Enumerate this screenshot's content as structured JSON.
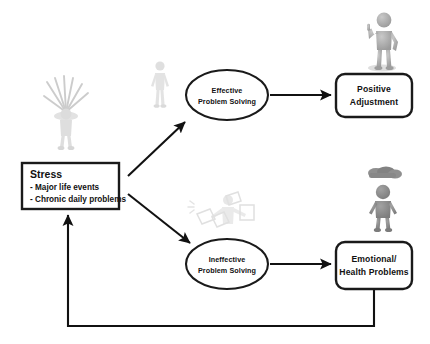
{
  "diagram": {
    "background_color": "#ffffff",
    "stroke_color": "#111111",
    "nodes": {
      "stress": {
        "shape": "rectangle",
        "heading": "Stress",
        "bullets": [
          "- Major life events",
          "- Chronic daily problems"
        ]
      },
      "effective": {
        "shape": "ellipse",
        "line1": "Effective",
        "line2": "Problem Solving"
      },
      "ineffective": {
        "shape": "ellipse",
        "line1": "Ineffective",
        "line2": "Problem Solving"
      },
      "positive": {
        "shape": "rounded-rectangle",
        "line1": "Positive",
        "line2": "Adjustment"
      },
      "emotional": {
        "shape": "rounded-rectangle",
        "line1": "Emotional/",
        "line2": "Health Problems"
      }
    },
    "figures": [
      {
        "name": "stressed-person-figure",
        "description": "pale grey figure with radiating stress lines",
        "color": "#cfcfcf"
      },
      {
        "name": "thinking-person-figure",
        "description": "pale grey standing figure",
        "color": "#dcdcdc"
      },
      {
        "name": "puzzled-person-figure",
        "description": "very pale grey figure with scattered papers",
        "color": "#e2e2e2"
      },
      {
        "name": "thumbs-up-person-figure",
        "description": "grey 3D mannequin giving a thumbs up",
        "color": "#a8a8a8"
      },
      {
        "name": "gloomy-person-figure",
        "description": "dark grey figure with a rain cloud overhead",
        "color": "#8a8a8a"
      }
    ],
    "connectors": [
      {
        "name": "stress-to-effective",
        "from": "stress",
        "to": "effective",
        "style": "arrow"
      },
      {
        "name": "stress-to-ineffective",
        "from": "stress",
        "to": "ineffective",
        "style": "arrow"
      },
      {
        "name": "effective-to-positive",
        "from": "effective",
        "to": "positive",
        "style": "arrow"
      },
      {
        "name": "ineffective-to-emotional",
        "from": "ineffective",
        "to": "emotional",
        "style": "arrow"
      },
      {
        "name": "emotional-feedback-to-stress",
        "from": "emotional",
        "to": "stress",
        "style": "arrow-feedback-loop"
      }
    ]
  }
}
